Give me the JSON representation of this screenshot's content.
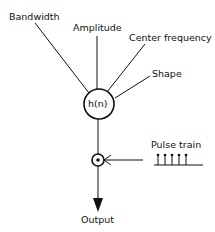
{
  "diagram": {
    "filter_label": "h(n)",
    "inputs": [
      "Bandwidth",
      "Amplitude",
      "Center frequency",
      "Shape"
    ],
    "pulse_label": "Pulse train",
    "multiplier_symbol": "×",
    "output_label": "Output",
    "pulse_count": 5
  }
}
